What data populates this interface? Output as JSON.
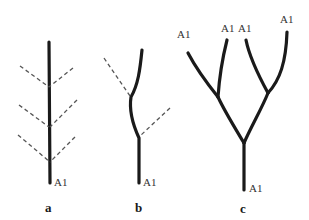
{
  "figure": {
    "panels": [
      {
        "id": "a",
        "caption": "a",
        "description": "Single straight axis with three pairs of dashed lateral branches",
        "labels": {
          "base": "A1"
        }
      },
      {
        "id": "b",
        "caption": "b",
        "description": "Sympodial axis with two dashed laterals",
        "labels": {
          "base": "A1"
        }
      },
      {
        "id": "c",
        "caption": "c",
        "description": "Repeated dichotomous branching; each tip labeled A1",
        "labels": {
          "base": "A1",
          "tip1": "A1",
          "tip2": "A1",
          "tip3": "A1",
          "tip4": "A1"
        }
      }
    ],
    "colors": {
      "stroke": "#1a1a1a",
      "dashed": "#555555",
      "background": "#ffffff"
    }
  }
}
